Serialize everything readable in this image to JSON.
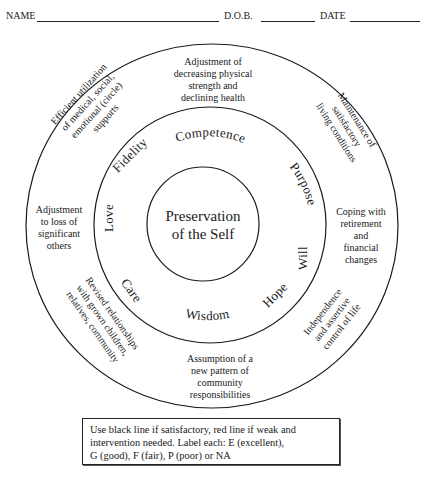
{
  "header": {
    "name_label": "NAME",
    "dob_label": "D.O.B.",
    "date_label": "DATE"
  },
  "center": {
    "line1": "Preservation",
    "line2": "of the Self"
  },
  "virtues": {
    "top": "Competence",
    "upper_right": "Purpose",
    "right": "Will",
    "lower_right": "Hope",
    "bottom": "Wisdom",
    "lower_left": "Care",
    "left": "Love",
    "upper_left": "Fidelity"
  },
  "tasks": {
    "top": [
      "Adjustment of",
      "decreasing physical",
      "strength and",
      "declining health"
    ],
    "upper_right": [
      "Maintenance of",
      "satisfactory",
      "living conditions"
    ],
    "right": [
      "Coping with",
      "retirement",
      "and",
      "financial",
      "changes"
    ],
    "lower_right": [
      "Independence",
      "and assertive",
      "control of life"
    ],
    "bottom": [
      "Assumption of a",
      "new pattern of",
      "community",
      "responsibilities"
    ],
    "lower_left": [
      "Revised relationships",
      "with grown children,",
      "relatives, community"
    ],
    "left": [
      "Adjustment",
      "to loss of",
      "significant",
      "others"
    ],
    "upper_left": [
      "Efficient utilization",
      "of medical, social,",
      "emotional (circle)",
      "supports"
    ]
  },
  "legend": {
    "line1": "Use black line if satisfactory, red line if weak and",
    "line2": "intervention needed.  Label each:  E (excellent),",
    "line3": "G (good), F (fair),  P (poor) or NA"
  },
  "colors": {
    "ink": "#1a1a1a",
    "paper": "#ffffff"
  }
}
